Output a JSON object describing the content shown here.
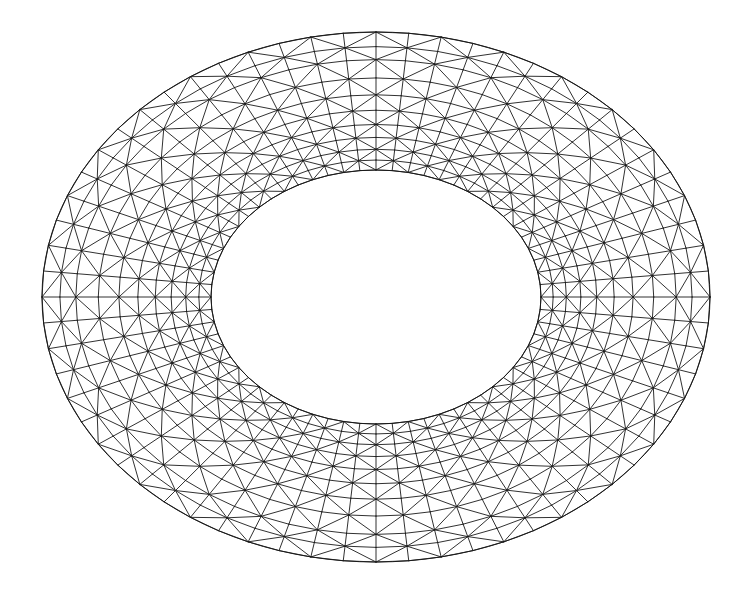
{
  "figure": {
    "title": "Triangulated Annulus Mesh",
    "canvas_width": 742,
    "canvas_height": 594,
    "background_color": "#ffffff",
    "line_color": "#1a1a1a",
    "line_width": 0.9,
    "boundary_line_width": 1.0
  },
  "chart_data": {
    "type": "diagram",
    "subtype": "triangular-mesh-annulus",
    "title": "Triangulated Annulus Mesh",
    "xlabel": "",
    "ylabel": "",
    "grid": false,
    "legend": null,
    "xlim": [
      0,
      742
    ],
    "ylim": [
      0,
      594
    ],
    "geometry": {
      "shape": "elliptical-annulus",
      "center_x": 376,
      "center_y": 297,
      "outer_rx": 334,
      "outer_ry": 265,
      "inner_rx": 165,
      "inner_ry": 127,
      "outer_bbox": {
        "left": 42,
        "top": 32,
        "right": 710,
        "bottom": 562
      },
      "inner_bbox": {
        "left": 211,
        "top": 170,
        "right": 541,
        "bottom": 424
      }
    },
    "mesh": {
      "angular_divisions": 64,
      "radial_divisions": 10,
      "radial_grading": "geometric, finer toward inner boundary",
      "radial_grading_ratio": 0.82,
      "cell_type": "quad split into two triangles by a diagonal",
      "diagonal_direction": "alternating",
      "node_count": 704,
      "triangle_count": 1280,
      "edge_draw_order": [
        "radial",
        "circumferential",
        "diagonal"
      ]
    },
    "rings_normalized_radius": [
      0.0,
      0.072,
      0.15,
      0.236,
      0.33,
      0.433,
      0.545,
      0.667,
      0.8,
      0.894,
      1.0
    ]
  }
}
